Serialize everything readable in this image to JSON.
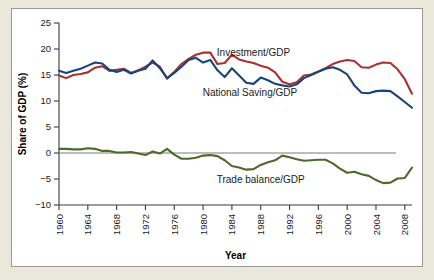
{
  "figure": {
    "panel_background": "#ffffff",
    "outer_background": "#e9e8da",
    "border_color": "#9a9a93"
  },
  "chart_data": {
    "type": "line",
    "title": "",
    "subtitle": "",
    "xlabel": "Year",
    "ylabel": "Share of GDP (%)",
    "xlim": [
      1960,
      2009
    ],
    "ylim": [
      -10,
      25
    ],
    "yticks": [
      -10,
      -5,
      0,
      5,
      10,
      15,
      20,
      25
    ],
    "ytick_labels": [
      "−10",
      "−5",
      "0",
      "5",
      "10",
      "15",
      "20",
      "25"
    ],
    "xticks": [
      1960,
      1964,
      1968,
      1972,
      1976,
      1980,
      1984,
      1988,
      1992,
      1996,
      2000,
      2004,
      2008
    ],
    "xtick_labels": [
      "1960",
      "1964",
      "1968",
      "1972",
      "1976",
      "1980",
      "1984",
      "1988",
      "1992",
      "1996",
      "2000",
      "2004",
      "2008"
    ],
    "grid": false,
    "legend_position": "inline-annotations",
    "zero_reference_line": true,
    "x": [
      1960,
      1961,
      1962,
      1963,
      1964,
      1965,
      1966,
      1967,
      1968,
      1969,
      1970,
      1971,
      1972,
      1973,
      1974,
      1975,
      1976,
      1977,
      1978,
      1979,
      1980,
      1981,
      1982,
      1983,
      1984,
      1985,
      1986,
      1987,
      1988,
      1989,
      1990,
      1991,
      1992,
      1993,
      1994,
      1995,
      1996,
      1997,
      1998,
      1999,
      2000,
      2001,
      2002,
      2003,
      2004,
      2005,
      2006,
      2007,
      2008,
      2009
    ],
    "series": [
      {
        "name": "Investment/GDP",
        "color": "#a83232",
        "label_x": 1987.0,
        "label_y": 19.3,
        "values": [
          14.9,
          14.4,
          15.0,
          15.2,
          15.5,
          16.4,
          16.7,
          15.8,
          16.0,
          16.2,
          15.4,
          15.9,
          16.6,
          17.4,
          16.6,
          14.3,
          15.6,
          17.1,
          18.1,
          18.9,
          19.3,
          19.3,
          17.1,
          17.3,
          18.9,
          18.0,
          17.6,
          17.3,
          16.8,
          16.4,
          15.5,
          13.7,
          13.2,
          13.6,
          14.9,
          15.1,
          15.7,
          16.3,
          17.1,
          17.6,
          17.9,
          17.7,
          16.5,
          16.4,
          17.0,
          17.4,
          17.3,
          16.1,
          14.2,
          11.4
        ]
      },
      {
        "name": "National Saving/GDP",
        "color": "#17457a",
        "label_x": 1986.5,
        "label_y": 11.7,
        "values": [
          15.8,
          15.4,
          15.8,
          16.2,
          16.8,
          17.4,
          17.2,
          16.0,
          15.6,
          16.0,
          15.3,
          15.8,
          16.2,
          17.8,
          16.3,
          14.4,
          15.4,
          16.6,
          17.9,
          18.3,
          17.4,
          17.9,
          15.9,
          14.6,
          16.3,
          14.9,
          13.5,
          13.3,
          14.5,
          14.0,
          13.3,
          13.0,
          12.8,
          13.2,
          14.4,
          15.0,
          15.6,
          16.2,
          16.5,
          16.0,
          15.1,
          13.0,
          11.6,
          11.5,
          11.9,
          12.0,
          11.9,
          10.9,
          9.8,
          8.7
        ]
      },
      {
        "name": "Trade balance/GDP",
        "color": "#4d6a2a",
        "label_x": 1988.0,
        "label_y": -5.1,
        "values": [
          0.8,
          0.8,
          0.7,
          0.7,
          0.9,
          0.8,
          0.4,
          0.4,
          0.1,
          0.1,
          0.2,
          -0.1,
          -0.4,
          0.3,
          -0.1,
          0.8,
          -0.3,
          -1.1,
          -1.1,
          -0.9,
          -0.5,
          -0.4,
          -0.6,
          -1.4,
          -2.5,
          -2.8,
          -3.2,
          -3.1,
          -2.3,
          -1.8,
          -1.4,
          -0.5,
          -0.8,
          -1.2,
          -1.5,
          -1.4,
          -1.3,
          -1.3,
          -2.0,
          -3.0,
          -3.8,
          -3.6,
          -4.1,
          -4.4,
          -5.2,
          -5.8,
          -5.7,
          -4.9,
          -4.8,
          -2.8
        ]
      }
    ]
  }
}
